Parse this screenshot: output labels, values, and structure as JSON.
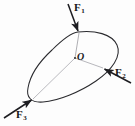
{
  "figure": {
    "kind": "free-body-diagram",
    "width": 135,
    "height": 126,
    "background_color": "#fdfdfd",
    "outline_color": "#2a2a2e",
    "construction_line_color": "#9a9aa0",
    "arrow_color": "#1d1d21",
    "body": {
      "name": "rigid-body-outline",
      "path": "M 78 32 C 95 30 112 34 117 45 C 122 56 112 70 96 81 C 80 92 58 101 43 102 C 31 103 26 97 28 88 C 30 76 39 62 52 50 C 61 41 70 33 78 32 Z"
    },
    "point_o": {
      "label": "O",
      "x": 75,
      "y": 58
    },
    "forces": [
      {
        "id": "f1",
        "label": "F",
        "subscript": "1",
        "tail_x": 68,
        "tail_y": 4,
        "head_x": 79,
        "head_y": 33,
        "direction": "down-right",
        "application_x": 79,
        "application_y": 33
      },
      {
        "id": "f2",
        "label": "F",
        "subscript": "2",
        "tail_x": 131,
        "tail_y": 83,
        "head_x": 103,
        "head_y": 68,
        "direction": "up-left",
        "application_x": 103,
        "application_y": 68
      },
      {
        "id": "f3",
        "label": "F",
        "subscript": "3",
        "tail_x": 4,
        "tail_y": 118,
        "head_x": 33,
        "head_y": 99,
        "direction": "up-right",
        "application_x": 33,
        "application_y": 99
      }
    ],
    "construction_lines": [
      {
        "id": "o-to-f1",
        "x1": 75,
        "y1": 58,
        "x2": 79,
        "y2": 33
      },
      {
        "id": "o-to-f2",
        "x1": 75,
        "y1": 58,
        "x2": 103,
        "y2": 68
      },
      {
        "id": "o-to-f3",
        "x1": 75,
        "y1": 58,
        "x2": 33,
        "y2": 99
      }
    ]
  }
}
